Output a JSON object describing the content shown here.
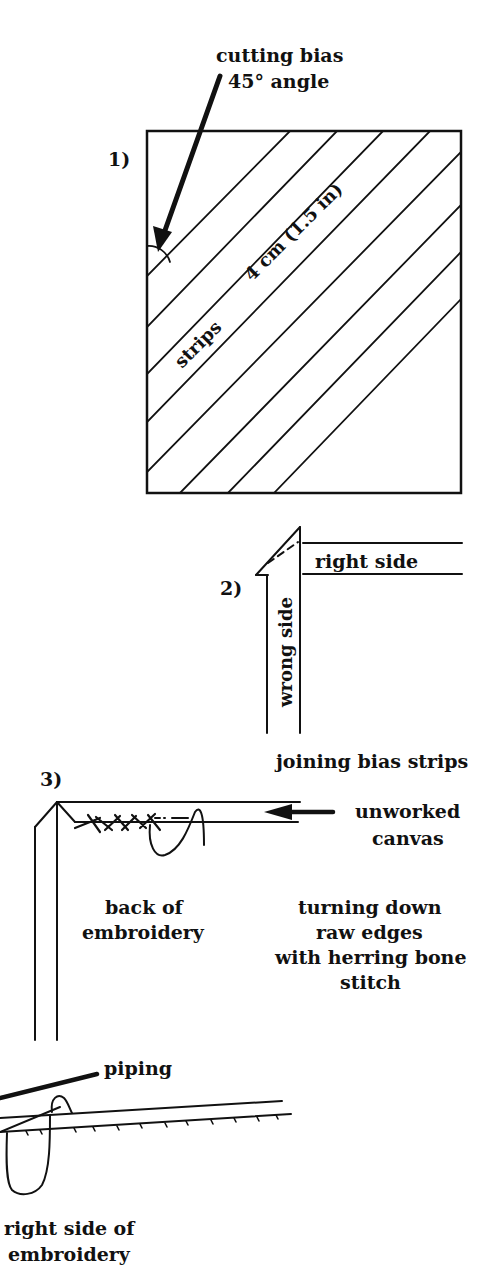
{
  "diagram": {
    "step1": {
      "number": "1)",
      "callout_line1": "cutting bias",
      "callout_line2": "45° angle",
      "strip_label": "strips",
      "width_label": "4 cm (1.5 in)"
    },
    "step2": {
      "number": "2)",
      "right_side": "right side",
      "wrong_side": "wrong side",
      "caption": "joining bias strips"
    },
    "step3": {
      "number": "3)",
      "unworked_line1": "unworked",
      "unworked_line2": "canvas",
      "back_line1": "back of",
      "back_line2": "embroidery",
      "turning_line1": "turning down",
      "turning_line2": "raw edges",
      "turning_line3": "with herring bone",
      "turning_line4": "stitch",
      "piping": "piping",
      "right_line1": "right side of",
      "right_line2": "embroidery"
    }
  }
}
